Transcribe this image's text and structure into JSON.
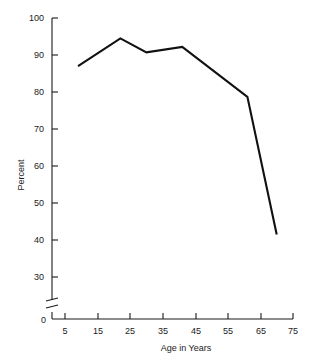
{
  "chart_data": {
    "type": "line",
    "title": "",
    "xlabel": "Age in Years",
    "ylabel": "Percent",
    "x": [
      9,
      22,
      30,
      41,
      61,
      70
    ],
    "values": [
      87,
      94.5,
      90.7,
      92.2,
      78.7,
      41.5
    ],
    "series": [
      {
        "name": "Percent",
        "x": [
          9,
          22,
          30,
          41,
          61,
          70
        ],
        "values": [
          87,
          94.5,
          90.7,
          92.2,
          78.7,
          41.5
        ]
      }
    ],
    "xlim": [
      0,
      75
    ],
    "ylim": [
      28,
      100
    ],
    "x_ticks": [
      5,
      15,
      25,
      35,
      45,
      55,
      65,
      75
    ],
    "x_tick_labels": [
      "5",
      "15",
      "25",
      "35",
      "45",
      "55",
      "65",
      "75"
    ],
    "y_ticks": [
      30,
      40,
      50,
      60,
      70,
      80,
      90,
      100
    ],
    "y_tick_labels": [
      "30",
      "40",
      "50",
      "60",
      "70",
      "80",
      "90",
      "100"
    ],
    "y_origin_label": "0",
    "y_axis_break": true,
    "grid": false,
    "legend": "none",
    "line_color": "#111111",
    "axis_color": "#1a1a1a",
    "background_color": "#ffffff",
    "annotations": []
  },
  "axes": {
    "y": {
      "title": "Percent",
      "ticks": [
        {
          "label": "100"
        },
        {
          "label": "90"
        },
        {
          "label": "80"
        },
        {
          "label": "70"
        },
        {
          "label": "60"
        },
        {
          "label": "50"
        },
        {
          "label": "40"
        },
        {
          "label": "30"
        },
        {
          "label": "0"
        }
      ]
    },
    "x": {
      "title": "Age in Years",
      "ticks": [
        {
          "label": "5"
        },
        {
          "label": "15"
        },
        {
          "label": "25"
        },
        {
          "label": "35"
        },
        {
          "label": "45"
        },
        {
          "label": "55"
        },
        {
          "label": "65"
        },
        {
          "label": "75"
        }
      ]
    }
  }
}
